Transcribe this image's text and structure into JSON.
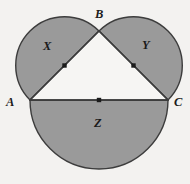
{
  "figure": {
    "background_color": "#f3f2f0",
    "fill_color": "#9a9a9a",
    "stroke_color": "#3c3c3c",
    "dot_color": "#1b1b1b",
    "vertices": {
      "A": {
        "label": "A",
        "x": 30,
        "y": 100
      },
      "B": {
        "label": "B",
        "x": 99,
        "y": 31
      },
      "C": {
        "label": "C",
        "x": 168,
        "y": 100
      }
    },
    "regions": [
      {
        "label": "X",
        "name": "semicircle-on-AB",
        "side": "AB",
        "center": {
          "x": 64.5,
          "y": 65.5
        },
        "radius": 48.8
      },
      {
        "label": "Y",
        "name": "semicircle-on-BC",
        "side": "BC",
        "center": {
          "x": 133.5,
          "y": 65.5
        },
        "radius": 48.8
      },
      {
        "label": "Z",
        "name": "semicircle-on-AC",
        "side": "AC",
        "center": {
          "x": 99,
          "y": 100
        },
        "radius": 69
      }
    ],
    "center_dots": [
      {
        "name": "midpoint-AB-dot",
        "x": 64.5,
        "y": 65.5
      },
      {
        "name": "midpoint-BC-dot",
        "x": 133.5,
        "y": 65.5
      },
      {
        "name": "midpoint-AC-dot",
        "x": 99,
        "y": 100
      }
    ],
    "segments": [
      {
        "name": "segment-AB",
        "from": "A",
        "to": "B"
      },
      {
        "name": "segment-BC",
        "from": "B",
        "to": "C"
      },
      {
        "name": "segment-AC",
        "from": "A",
        "to": "C"
      }
    ]
  }
}
